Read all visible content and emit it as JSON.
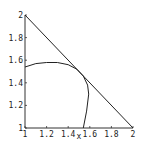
{
  "chart_data": {
    "type": "line",
    "title": "",
    "xlabel": "x",
    "ylabel": "",
    "xlim": [
      1,
      2
    ],
    "ylim": [
      1,
      2
    ],
    "grid": false,
    "x_ticks": [
      "1",
      "1.2",
      "1.4",
      "1.6",
      "1.8",
      "2"
    ],
    "y_ticks": [
      "1",
      "1.2",
      "1.4",
      "1.6",
      "1.8",
      "2"
    ],
    "series": [
      {
        "name": "line",
        "x": [
          1,
          2
        ],
        "y": [
          2,
          1
        ]
      },
      {
        "name": "arc",
        "x": [
          1.0,
          1.1,
          1.2,
          1.3,
          1.4,
          1.48,
          1.54,
          1.58,
          1.59,
          1.57,
          1.54
        ],
        "y": [
          1.54,
          1.57,
          1.58,
          1.58,
          1.56,
          1.52,
          1.46,
          1.38,
          1.3,
          1.15,
          1.0
        ]
      }
    ]
  }
}
